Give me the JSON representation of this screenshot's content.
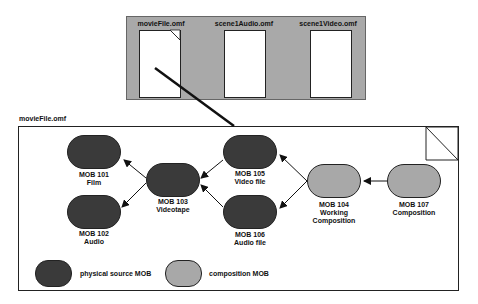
{
  "files": [
    {
      "name": "movieFile.omf"
    },
    {
      "name": "scene1Audio.omf"
    },
    {
      "name": "scene1Video.omf"
    }
  ],
  "expanded_file": {
    "title": "movieFile.omf"
  },
  "mobs": [
    {
      "id": "MOB 101",
      "desc": "Film",
      "kind": "physical"
    },
    {
      "id": "MOB 102",
      "desc": "Audio",
      "kind": "physical"
    },
    {
      "id": "MOB 103",
      "desc": "Videotape",
      "kind": "physical"
    },
    {
      "id": "MOB 105",
      "desc": "Video file",
      "kind": "physical"
    },
    {
      "id": "MOB 106",
      "desc": "Audio file",
      "kind": "physical"
    },
    {
      "id": "MOB 104",
      "desc": "Working Composition",
      "desc1": "Working",
      "desc2": "Composition",
      "kind": "composition"
    },
    {
      "id": "MOB 107",
      "desc": "Composition",
      "kind": "composition"
    }
  ],
  "edges": [
    {
      "from": "MOB 103",
      "to": "MOB 101"
    },
    {
      "from": "MOB 103",
      "to": "MOB 102"
    },
    {
      "from": "MOB 105",
      "to": "MOB 103"
    },
    {
      "from": "MOB 106",
      "to": "MOB 103"
    },
    {
      "from": "MOB 104",
      "to": "MOB 105"
    },
    {
      "from": "MOB 104",
      "to": "MOB 106"
    },
    {
      "from": "MOB 107",
      "to": "MOB 104"
    }
  ],
  "legend": [
    {
      "label": "physical source MOB",
      "color": "#3a3a3a"
    },
    {
      "label": "composition MOB",
      "color": "#a8a8a8"
    }
  ],
  "colors": {
    "panel": "#a9a9a9",
    "physical": "#3a3a3a",
    "composition": "#a8a8a8"
  }
}
